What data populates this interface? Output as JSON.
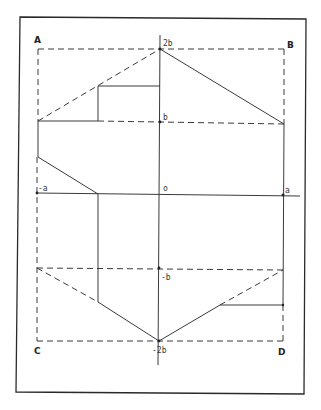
{
  "diagram": {
    "colors": {
      "ink": "#3a3a3a",
      "border": "#2a2a2a",
      "background": "#ffffff"
    },
    "corner_labels": {
      "A": "A",
      "B": "B",
      "C": "C",
      "D": "D"
    },
    "axis_labels": {
      "top": "2b",
      "b": "b",
      "origin": "o",
      "neg_a": "-a",
      "a": "a",
      "neg_b": "-b",
      "bottom": "-2b"
    }
  }
}
